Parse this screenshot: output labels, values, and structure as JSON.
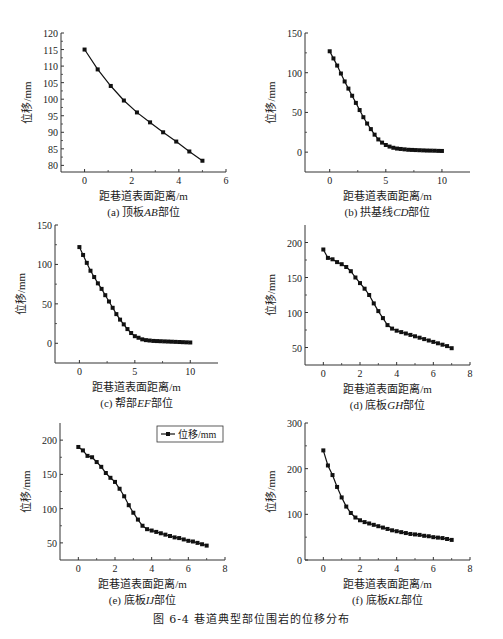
{
  "figure": {
    "caption": "图 6-4   巷道典型部位围岩的位移分布"
  },
  "chart_data": [
    {
      "id": "a",
      "type": "line",
      "subtitle": "(a) 顶板AB部位",
      "xlabel": "距巷道表面距离/m",
      "ylabel": "位移/mm",
      "xlim": [
        -1,
        6
      ],
      "ylim": [
        78,
        120
      ],
      "xticks": [
        0,
        2,
        4,
        6
      ],
      "yticks": [
        80,
        85,
        90,
        95,
        100,
        105,
        110,
        115,
        120
      ],
      "x": [
        0,
        0.556,
        1.111,
        1.667,
        2.222,
        2.778,
        3.333,
        3.889,
        4.444,
        5.0
      ],
      "values": [
        115,
        109,
        104,
        99.6,
        96,
        93,
        90,
        87.2,
        84.2,
        81.4
      ],
      "legend": null
    },
    {
      "id": "b",
      "type": "line",
      "subtitle": "(b) 拱基线CD部位",
      "xlabel": "距巷道表面距离/m",
      "ylabel": "位移/mm",
      "xlim": [
        -2.2,
        12.5
      ],
      "ylim": [
        -25,
        150
      ],
      "xticks": [
        0,
        5,
        10
      ],
      "yticks": [
        0,
        50,
        100,
        150
      ],
      "x": [
        0,
        0.333,
        0.667,
        1.0,
        1.333,
        1.667,
        2.0,
        2.333,
        2.667,
        3.0,
        3.333,
        3.667,
        4.0,
        4.333,
        4.667,
        5.0,
        5.333,
        5.667,
        6.0,
        6.333,
        6.667,
        7.0,
        7.333,
        7.667,
        8.0,
        8.333,
        8.667,
        9.0,
        9.333,
        9.667,
        10.0
      ],
      "values": [
        127,
        118,
        109,
        99,
        89,
        80,
        71,
        62,
        53,
        44,
        36,
        29,
        22,
        16,
        12,
        9,
        7,
        5.5,
        4.5,
        4,
        3.5,
        3,
        2.8,
        2.6,
        2.4,
        2.2,
        2,
        1.9,
        1.8,
        1.6,
        1.5
      ],
      "legend": null
    },
    {
      "id": "c",
      "type": "line",
      "subtitle": "(c) 帮部EF部位",
      "xlabel": "距巷道表面距离/m",
      "ylabel": "位移/mm",
      "xlim": [
        -2.2,
        12.5
      ],
      "ylim": [
        -25,
        150
      ],
      "xticks": [
        0,
        5,
        10
      ],
      "yticks": [
        0,
        50,
        100,
        150
      ],
      "x": [
        0,
        0.333,
        0.667,
        1.0,
        1.333,
        1.667,
        2.0,
        2.333,
        2.667,
        3.0,
        3.333,
        3.667,
        4.0,
        4.333,
        4.667,
        5.0,
        5.333,
        5.667,
        6.0,
        6.333,
        6.667,
        7.0,
        7.333,
        7.667,
        8.0,
        8.333,
        8.667,
        9.0,
        9.333,
        9.667,
        10.0
      ],
      "values": [
        122,
        112,
        102,
        92,
        84,
        76,
        69,
        61,
        53,
        45,
        37,
        30,
        24,
        18,
        13,
        9,
        7,
        5,
        4,
        3.5,
        3,
        2.8,
        2.6,
        2.4,
        2.2,
        2,
        1.8,
        1.6,
        1.4,
        1.2,
        1
      ],
      "legend": null
    },
    {
      "id": "d",
      "type": "line",
      "subtitle": "(d) 底板GH部位",
      "xlabel": "距巷道表面距离/m",
      "ylabel": "位移/mm",
      "xlim": [
        -1,
        8
      ],
      "ylim": [
        25,
        225
      ],
      "xticks": [
        0,
        2,
        4,
        6,
        8
      ],
      "yticks": [
        50,
        100,
        150,
        200
      ],
      "x": [
        0,
        0.25,
        0.5,
        0.75,
        1.0,
        1.25,
        1.5,
        1.75,
        2.0,
        2.25,
        2.5,
        2.75,
        3.0,
        3.25,
        3.5,
        3.75,
        4.0,
        4.25,
        4.5,
        4.75,
        5.0,
        5.25,
        5.5,
        5.75,
        6.0,
        6.25,
        6.5,
        6.75,
        7.0
      ],
      "values": [
        190,
        178,
        176,
        172,
        169,
        165,
        159,
        150,
        142,
        134,
        125,
        113,
        102,
        92,
        82,
        77,
        74,
        72,
        70,
        68,
        66,
        64,
        62,
        60,
        58,
        56,
        54,
        52,
        49
      ],
      "legend": null
    },
    {
      "id": "e",
      "type": "line",
      "subtitle": "(e) 底板IJ部位",
      "xlabel": "距巷道表面距离/m",
      "ylabel": "位移/mm",
      "xlim": [
        -1,
        8
      ],
      "ylim": [
        25,
        225
      ],
      "xticks": [
        0,
        2,
        4,
        6,
        8
      ],
      "yticks": [
        50,
        100,
        150,
        200
      ],
      "x": [
        0,
        0.25,
        0.5,
        0.75,
        1.0,
        1.25,
        1.5,
        1.75,
        2.0,
        2.25,
        2.5,
        2.75,
        3.0,
        3.25,
        3.5,
        3.75,
        4.0,
        4.25,
        4.5,
        4.75,
        5.0,
        5.25,
        5.5,
        5.75,
        6.0,
        6.25,
        6.5,
        6.75,
        7.0
      ],
      "values": [
        190,
        185,
        177,
        175,
        168,
        161,
        152,
        145,
        139,
        129,
        118,
        105,
        94,
        84,
        75,
        70,
        68,
        66,
        64,
        62,
        60,
        58,
        57,
        55,
        53,
        52,
        50,
        48,
        46
      ],
      "legend": {
        "label": "位移/mm",
        "position": "upper right"
      }
    },
    {
      "id": "f",
      "type": "line",
      "subtitle": "(f) 底板KL部位",
      "xlabel": "距巷道表面距离/m",
      "ylabel": "位移/mm",
      "xlim": [
        -1,
        8
      ],
      "ylim": [
        0,
        300
      ],
      "xticks": [
        0,
        2,
        4,
        6,
        8
      ],
      "yticks": [
        0,
        100,
        200,
        300
      ],
      "x": [
        0,
        0.25,
        0.5,
        0.75,
        1.0,
        1.25,
        1.5,
        1.75,
        2.0,
        2.25,
        2.5,
        2.75,
        3.0,
        3.25,
        3.5,
        3.75,
        4.0,
        4.25,
        4.5,
        4.75,
        5.0,
        5.25,
        5.5,
        5.75,
        6.0,
        6.25,
        6.5,
        6.75,
        7.0
      ],
      "values": [
        240,
        207,
        186,
        160,
        137,
        117,
        103,
        93,
        87,
        83,
        80,
        77,
        74,
        71,
        68,
        65,
        63,
        61,
        59,
        57,
        56,
        55,
        53,
        52,
        50,
        49,
        48,
        46,
        44
      ],
      "legend": null
    }
  ],
  "panels": {
    "a": {
      "subtitle_prefix": "(a) 顶板",
      "subtitle_italic": "AB",
      "subtitle_suffix": "部位"
    },
    "b": {
      "subtitle_prefix": "(b) 拱基线",
      "subtitle_italic": "CD",
      "subtitle_suffix": "部位"
    },
    "c": {
      "subtitle_prefix": "(c) 帮部",
      "subtitle_italic": "EF",
      "subtitle_suffix": "部位"
    },
    "d": {
      "subtitle_prefix": "(d) 底板",
      "subtitle_italic": "GH",
      "subtitle_suffix": "部位"
    },
    "e": {
      "subtitle_prefix": "(e) 底板",
      "subtitle_italic": "IJ",
      "subtitle_suffix": "部位"
    },
    "f": {
      "subtitle_prefix": "(f) 底板",
      "subtitle_italic": "KL",
      "subtitle_suffix": "部位"
    }
  }
}
